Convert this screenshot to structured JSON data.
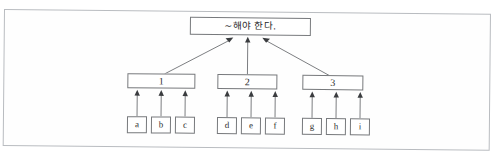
{
  "page": {
    "background_color": "#ffffff",
    "frame_color": "#b9bcc0",
    "node_border_color": "#77797c",
    "edge_color": "#6e7073",
    "arrowhead_color": "#3a3c3f"
  },
  "diagram": {
    "type": "tree",
    "orientation": "bottom-up-arrows",
    "root": {
      "id": "root",
      "label": "~해야 한다.",
      "x": 190,
      "y": 15,
      "w": 121,
      "h": 18
    },
    "levels": [
      {
        "name": "middle",
        "nodes": [
          {
            "id": "n1",
            "label": "1",
            "x": 128,
            "y": 72,
            "w": 68,
            "h": 15
          },
          {
            "id": "n2",
            "label": "2",
            "x": 218,
            "y": 72,
            "w": 60,
            "h": 15
          },
          {
            "id": "n3",
            "label": "3",
            "x": 303,
            "y": 72,
            "w": 61,
            "h": 15
          }
        ]
      },
      {
        "name": "leaves",
        "nodes": [
          {
            "id": "a",
            "label": "a",
            "parent": "n1",
            "x": 128,
            "y": 115,
            "w": 20,
            "h": 17
          },
          {
            "id": "b",
            "label": "b",
            "parent": "n1",
            "x": 152,
            "y": 115,
            "w": 20,
            "h": 17
          },
          {
            "id": "c",
            "label": "c",
            "parent": "n1",
            "x": 176,
            "y": 115,
            "w": 20,
            "h": 17
          },
          {
            "id": "d",
            "label": "d",
            "parent": "n2",
            "x": 218,
            "y": 115,
            "w": 20,
            "h": 17
          },
          {
            "id": "e",
            "label": "e",
            "parent": "n2",
            "x": 242,
            "y": 115,
            "w": 20,
            "h": 17
          },
          {
            "id": "f",
            "label": "f",
            "parent": "n2",
            "x": 266,
            "y": 115,
            "w": 20,
            "h": 17
          },
          {
            "id": "g",
            "label": "g",
            "parent": "n3",
            "x": 303,
            "y": 115,
            "w": 20,
            "h": 17
          },
          {
            "id": "h",
            "label": "h",
            "parent": "n3",
            "x": 327,
            "y": 115,
            "w": 20,
            "h": 17
          },
          {
            "id": "i",
            "label": "i",
            "parent": "n3",
            "x": 351,
            "y": 115,
            "w": 20,
            "h": 17
          }
        ]
      }
    ],
    "edges": [
      {
        "from": "n1",
        "to": "root",
        "style": "diagonal-arrow"
      },
      {
        "from": "n2",
        "to": "root",
        "style": "vertical-arrow"
      },
      {
        "from": "n3",
        "to": "root",
        "style": "diagonal-arrow"
      },
      {
        "from": "a",
        "to": "n1",
        "style": "vertical-arrow"
      },
      {
        "from": "b",
        "to": "n1",
        "style": "vertical-arrow"
      },
      {
        "from": "c",
        "to": "n1",
        "style": "vertical-arrow"
      },
      {
        "from": "d",
        "to": "n2",
        "style": "vertical-arrow"
      },
      {
        "from": "e",
        "to": "n2",
        "style": "vertical-arrow"
      },
      {
        "from": "f",
        "to": "n2",
        "style": "vertical-arrow"
      },
      {
        "from": "g",
        "to": "n3",
        "style": "vertical-arrow"
      },
      {
        "from": "h",
        "to": "n3",
        "style": "vertical-arrow"
      },
      {
        "from": "i",
        "to": "n3",
        "style": "vertical-arrow"
      }
    ]
  }
}
